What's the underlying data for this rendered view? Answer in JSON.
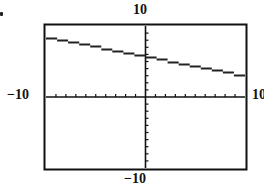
{
  "chart_data": {
    "type": "line",
    "title": "",
    "xlabel": "",
    "ylabel": "",
    "xlim": [
      -10,
      10
    ],
    "ylim": [
      -10,
      10
    ],
    "grid": false,
    "axis_ticks": {
      "x_step": 1,
      "y_step": 1
    },
    "window_labels": {
      "ymax": "10",
      "ymin": "−10",
      "xmin": "−10",
      "xmax": "10"
    },
    "series": [
      {
        "name": "line",
        "x": [
          -10,
          -5,
          0,
          5,
          10
        ],
        "y": [
          8.5,
          7.3,
          6.0,
          4.5,
          3.0
        ]
      }
    ],
    "style": "graphing-calculator window, pixelated line"
  },
  "labels": {
    "top": "10",
    "bottom": "−10",
    "left": "−10",
    "right": "10"
  },
  "colors": {
    "line": "#222222",
    "frame": "#111111",
    "background": "#ffffff"
  }
}
